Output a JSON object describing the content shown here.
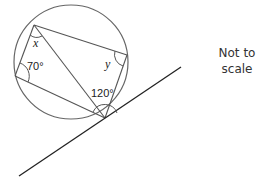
{
  "diagram": {
    "type": "circle-theorem",
    "labels": {
      "angle_x": "x",
      "angle_y": "y",
      "angle_70": "70°",
      "angle_120": "120°"
    },
    "note_line1": "Not to",
    "note_line2": "scale",
    "colors": {
      "circle": "#666666",
      "chords": "#555555",
      "tangent": "#222222"
    }
  }
}
